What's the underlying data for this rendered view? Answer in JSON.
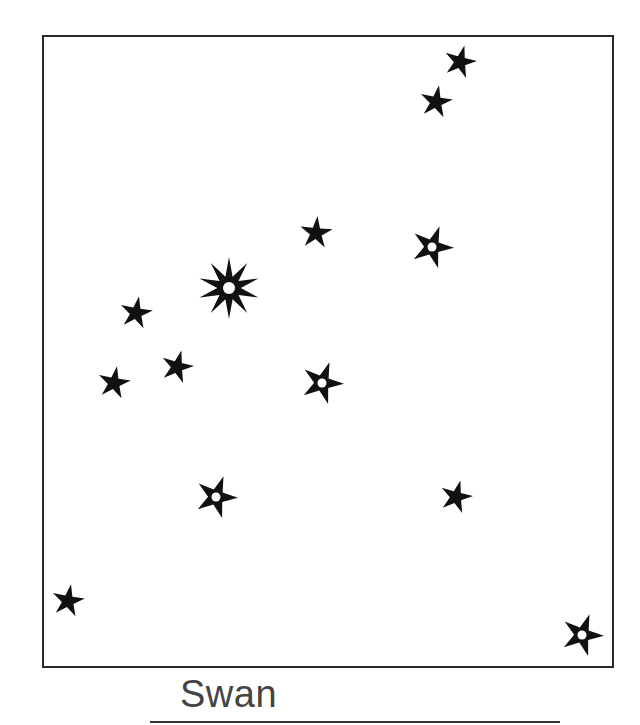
{
  "constellation": {
    "title": "Swan",
    "frame_color": "#2a2a2a",
    "star_color": "#111111",
    "stars": [
      {
        "x": 460,
        "y": 62,
        "type": "small",
        "points": 5,
        "r": 17,
        "rot": 15
      },
      {
        "x": 436,
        "y": 102,
        "type": "small",
        "points": 5,
        "r": 17,
        "rot": 10
      },
      {
        "x": 316,
        "y": 233,
        "type": "small",
        "points": 5,
        "r": 17,
        "rot": 5
      },
      {
        "x": 432,
        "y": 247,
        "type": "ring",
        "points": 5,
        "r": 22,
        "rot": 20
      },
      {
        "x": 229,
        "y": 288,
        "type": "bright",
        "points": 10,
        "r": 31,
        "rot": 0
      },
      {
        "x": 136,
        "y": 313,
        "type": "small",
        "points": 5,
        "r": 17,
        "rot": 10
      },
      {
        "x": 114,
        "y": 383,
        "type": "small",
        "points": 5,
        "r": 17,
        "rot": 10
      },
      {
        "x": 177,
        "y": 367,
        "type": "small",
        "points": 5,
        "r": 17,
        "rot": 15
      },
      {
        "x": 322,
        "y": 383,
        "type": "ring",
        "points": 5,
        "r": 22,
        "rot": 20
      },
      {
        "x": 216,
        "y": 497,
        "type": "ring",
        "points": 5,
        "r": 22,
        "rot": 20
      },
      {
        "x": 456,
        "y": 497,
        "type": "small",
        "points": 5,
        "r": 17,
        "rot": 15
      },
      {
        "x": 68,
        "y": 601,
        "type": "small",
        "points": 5,
        "r": 17,
        "rot": 10
      },
      {
        "x": 582,
        "y": 635,
        "type": "ring",
        "points": 5,
        "r": 22,
        "rot": 20
      }
    ]
  }
}
